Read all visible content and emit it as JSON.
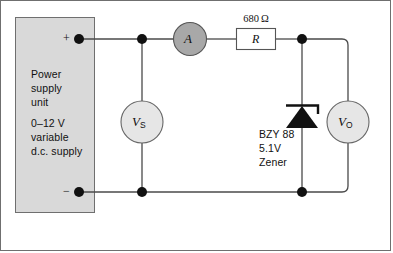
{
  "diagram": {
    "background_color": "#ffffff",
    "border_color": "#6f6f6f",
    "wire_color": "#4a4a4a"
  },
  "power_supply": {
    "name": "power-supply-unit",
    "fill_color": "#d9d9d9",
    "stroke_color": "#6f6f6f",
    "line1": "Power",
    "line2": "supply",
    "line3": "unit",
    "line4": "0–12 V",
    "line5": "variable",
    "line6": "d.c. supply",
    "positive_terminal_label": "+",
    "negative_terminal_label": "−"
  },
  "ammeter": {
    "label": "A",
    "fill_color": "#a8a8a8",
    "stroke_color": "#555555"
  },
  "resistor": {
    "symbol": "R",
    "value": "680 Ω",
    "fill_color": "#ffffff",
    "stroke_color": "#555555"
  },
  "voltmeter_source": {
    "label": "V",
    "subscript": "S",
    "fill_color": "#e6e6e6",
    "stroke_color": "#666666"
  },
  "voltmeter_output": {
    "label": "V",
    "subscript": "O",
    "fill_color": "#e6e6e6",
    "stroke_color": "#666666"
  },
  "zener_diode": {
    "line1": "BZY 88",
    "line2": "5.1V",
    "line3": "Zener",
    "fill_color": "#000000"
  }
}
